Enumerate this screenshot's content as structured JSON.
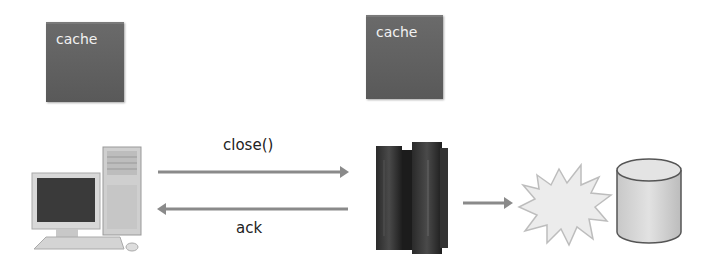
{
  "diagram": {
    "cache_left": {
      "label": "cache"
    },
    "cache_right": {
      "label": "cache"
    },
    "request_arrow": {
      "label": "close()"
    },
    "response_arrow": {
      "label": "ack"
    },
    "nodes": {
      "client": "desktop-computer",
      "server": "server-rack",
      "network": "explosion-burst",
      "storage": "database-cylinder"
    },
    "colors": {
      "cache_fill": "#5f5f5f",
      "cache_text": "#f2f2f2",
      "arrow": "#8a8a8a",
      "label_text": "#222222"
    }
  }
}
